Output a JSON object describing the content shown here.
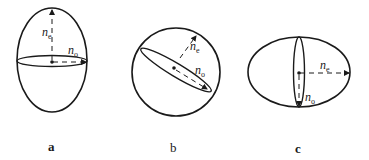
{
  "figure": {
    "panels": [
      {
        "id": "a",
        "caption": "a",
        "shape": "prolate ellipsoid",
        "labels": {
          "ne": "n",
          "ne_sub": "e",
          "no": "n",
          "no_sub": "o"
        }
      },
      {
        "id": "b",
        "caption": "b",
        "shape": "sphere with tilted section",
        "labels": {
          "ne": "n",
          "ne_sub": "e",
          "no": "n",
          "no_sub": "o"
        }
      },
      {
        "id": "c",
        "caption": "c",
        "shape": "oblate ellipsoid",
        "labels": {
          "ne": "n",
          "ne_sub": "e",
          "no": "n",
          "no_sub": "o"
        }
      }
    ],
    "colors": {
      "stroke": "#1a1a1a",
      "background": "#ffffff"
    }
  }
}
